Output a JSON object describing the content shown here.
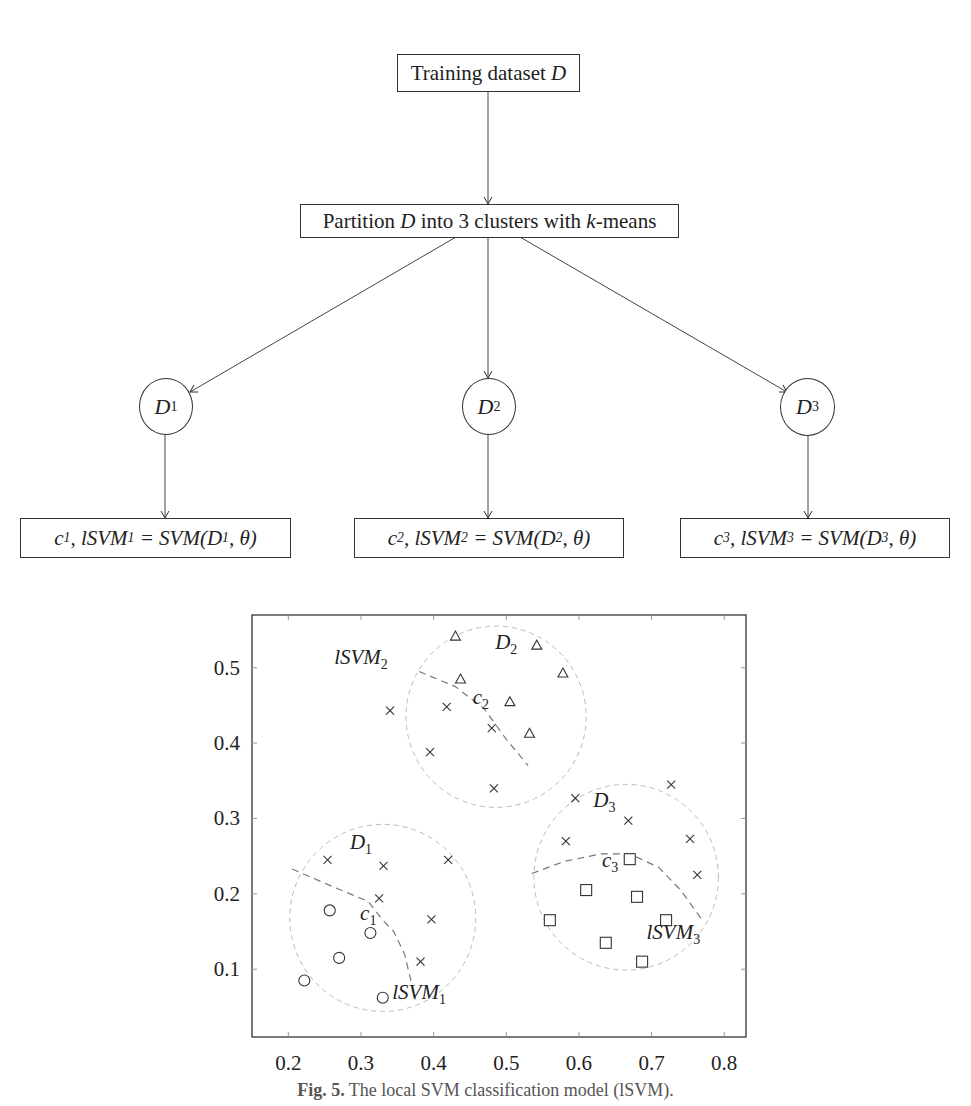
{
  "flowchart": {
    "root": {
      "text_prefix": "Training dataset ",
      "text_var": "D"
    },
    "partition": {
      "pre": "Partition ",
      "var": "D",
      "mid": " into 3 clusters with ",
      "kvar": "k",
      "post": "-means"
    },
    "clusters": [
      {
        "node": "D",
        "sub": "1",
        "model": {
          "c": "c",
          "csub": "1",
          "l": "lSVM",
          "lsub": "1",
          "rhs": "SVM(D",
          "rsub": "1",
          "tail": ", θ)"
        }
      },
      {
        "node": "D",
        "sub": "2",
        "model": {
          "c": "c",
          "csub": "2",
          "l": "lSVM",
          "lsub": "2",
          "rhs": "SVM(D",
          "rsub": "2",
          "tail": ", θ)"
        }
      },
      {
        "node": "D",
        "sub": "3",
        "model": {
          "c": "c",
          "csub": "3",
          "l": "lSVM",
          "lsub": "3",
          "rhs": "SVM(D",
          "rsub": "3",
          "tail": ", θ)"
        }
      }
    ]
  },
  "chart_data": {
    "type": "scatter",
    "title": "",
    "xlabel": "",
    "ylabel": "",
    "xlim": [
      0.15,
      0.83
    ],
    "ylim": [
      0.01,
      0.57
    ],
    "x_ticks": [
      "0.2",
      "0.3",
      "0.4",
      "0.5",
      "0.6",
      "0.7",
      "0.8"
    ],
    "y_ticks": [
      "0.1",
      "0.2",
      "0.3",
      "0.4",
      "0.5"
    ],
    "grid": false,
    "series": [
      {
        "name": "cross",
        "marker": "x",
        "points": [
          [
            0.254,
            0.245
          ],
          [
            0.331,
            0.237
          ],
          [
            0.42,
            0.245
          ],
          [
            0.325,
            0.194
          ],
          [
            0.397,
            0.166
          ],
          [
            0.382,
            0.11
          ],
          [
            0.34,
            0.443
          ],
          [
            0.418,
            0.448
          ],
          [
            0.395,
            0.388
          ],
          [
            0.48,
            0.42
          ],
          [
            0.483,
            0.34
          ],
          [
            0.595,
            0.327
          ],
          [
            0.668,
            0.297
          ],
          [
            0.582,
            0.27
          ],
          [
            0.727,
            0.345
          ],
          [
            0.753,
            0.273
          ],
          [
            0.763,
            0.225
          ]
        ]
      },
      {
        "name": "circle",
        "marker": "o",
        "points": [
          [
            0.257,
            0.178
          ],
          [
            0.313,
            0.148
          ],
          [
            0.27,
            0.115
          ],
          [
            0.222,
            0.085
          ],
          [
            0.33,
            0.062
          ]
        ]
      },
      {
        "name": "triangle",
        "marker": "^",
        "points": [
          [
            0.43,
            0.542
          ],
          [
            0.437,
            0.485
          ],
          [
            0.542,
            0.53
          ],
          [
            0.578,
            0.493
          ],
          [
            0.505,
            0.455
          ],
          [
            0.532,
            0.413
          ]
        ]
      },
      {
        "name": "square",
        "marker": "s",
        "points": [
          [
            0.67,
            0.246
          ],
          [
            0.61,
            0.205
          ],
          [
            0.68,
            0.196
          ],
          [
            0.56,
            0.165
          ],
          [
            0.72,
            0.165
          ],
          [
            0.637,
            0.135
          ],
          [
            0.687,
            0.11
          ]
        ]
      }
    ],
    "annotations": [
      {
        "text": "D",
        "sub": "1",
        "x": 0.3,
        "y": 0.26
      },
      {
        "text": "D",
        "sub": "2",
        "x": 0.5,
        "y": 0.525
      },
      {
        "text": "D",
        "sub": "3",
        "x": 0.635,
        "y": 0.315
      },
      {
        "text": "c",
        "sub": "1",
        "x": 0.31,
        "y": 0.165
      },
      {
        "text": "c",
        "sub": "2",
        "x": 0.465,
        "y": 0.452
      },
      {
        "text": "c",
        "sub": "3",
        "x": 0.643,
        "y": 0.235
      },
      {
        "text": "lSVM",
        "sub": "1",
        "x": 0.38,
        "y": 0.06
      },
      {
        "text": "lSVM",
        "sub": "2",
        "x": 0.3,
        "y": 0.505
      },
      {
        "text": "lSVM",
        "sub": "3",
        "x": 0.73,
        "y": 0.14
      }
    ],
    "cluster_circles": [
      {
        "cx": 0.33,
        "cy": 0.168,
        "r": 0.128
      },
      {
        "cx": 0.486,
        "cy": 0.435,
        "r": 0.124
      },
      {
        "cx": 0.665,
        "cy": 0.222,
        "r": 0.127
      }
    ]
  },
  "caption": {
    "label": "Fig. 5.",
    "text": " The local SVM classification model (lSVM)."
  }
}
